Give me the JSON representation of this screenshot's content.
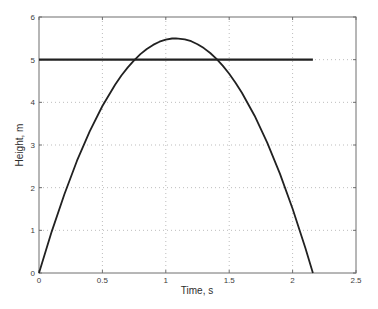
{
  "chart_data": {
    "type": "line",
    "title": "",
    "xlabel": "Time, s",
    "ylabel": "Height, m",
    "xlim": [
      0,
      2.5
    ],
    "ylim": [
      0,
      6
    ],
    "xtick_values": [
      0,
      0.5,
      1,
      1.5,
      2,
      2.5
    ],
    "xtick_labels": [
      "0",
      "0.5",
      "1",
      "1.5",
      "2",
      "2.5"
    ],
    "ytick_values": [
      0,
      1,
      2,
      3,
      4,
      5,
      6
    ],
    "ytick_labels": [
      "0",
      "1",
      "2",
      "3",
      "4",
      "5",
      "6"
    ],
    "grid": true,
    "grid_style": "dotted",
    "legend": null,
    "colors": {
      "background": "#ffffff",
      "axis_box": "#6e6e6e",
      "grid": "#bdbdbd",
      "tick_label": "#3d3d3d",
      "curve": "#212121"
    },
    "series": [
      {
        "name": "projectile-height",
        "peak": [
          1.08,
          5.5
        ],
        "color": "#212121",
        "width": 1.8,
        "points": [
          [
            0,
            0
          ],
          [
            0.1,
            0.971
          ],
          [
            0.2,
            1.848
          ],
          [
            0.3,
            2.631
          ],
          [
            0.4,
            3.32
          ],
          [
            0.5,
            3.914
          ],
          [
            0.6,
            4.413
          ],
          [
            0.65,
            4.628
          ],
          [
            0.7,
            4.819
          ],
          [
            0.75,
            4.986
          ],
          [
            0.8,
            5.13
          ],
          [
            0.85,
            5.25
          ],
          [
            0.9,
            5.347
          ],
          [
            0.95,
            5.42
          ],
          [
            1.0,
            5.47
          ],
          [
            1.05,
            5.496
          ],
          [
            1.08,
            5.5
          ],
          [
            1.15,
            5.477
          ],
          [
            1.2,
            5.432
          ],
          [
            1.25,
            5.363
          ],
          [
            1.3,
            5.271
          ],
          [
            1.35,
            5.156
          ],
          [
            1.4,
            5.017
          ],
          [
            1.45,
            4.854
          ],
          [
            1.5,
            4.668
          ],
          [
            1.55,
            4.458
          ],
          [
            1.6,
            4.225
          ],
          [
            1.7,
            3.687
          ],
          [
            1.8,
            3.055
          ],
          [
            1.9,
            2.329
          ],
          [
            2.0,
            1.508
          ],
          [
            2.1,
            0.594
          ],
          [
            2.16,
            0
          ]
        ]
      },
      {
        "name": "reference-height-5m",
        "color": "#212121",
        "width": 2.2,
        "points": [
          [
            0,
            5
          ],
          [
            2.16,
            5
          ]
        ]
      }
    ]
  }
}
